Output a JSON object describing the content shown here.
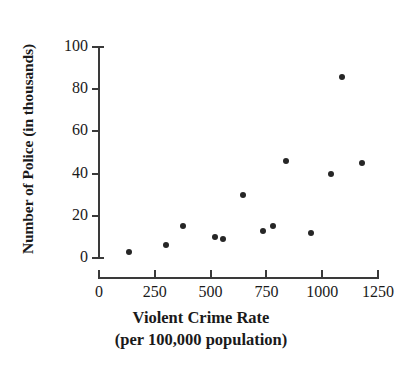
{
  "chart_data": {
    "type": "scatter",
    "title": "",
    "xlabel": "Violent Crime Rate",
    "xlabel_line2": "(per 100,000 population)",
    "ylabel": "Number of Police (in thousands)",
    "xlim": [
      0,
      1250
    ],
    "ylim": [
      0,
      100
    ],
    "xticks": [
      0,
      250,
      500,
      750,
      1000,
      1250
    ],
    "xtick_labels": [
      "0",
      "250",
      "500",
      "750",
      "1000",
      "1250"
    ],
    "yticks": [
      0,
      20,
      40,
      60,
      80,
      100
    ],
    "ytick_labels": [
      "0",
      "20",
      "40",
      "60",
      "80",
      "100"
    ],
    "grid": false,
    "legend": null,
    "marker_color": "#262626",
    "axis_color": "#3a3a3a",
    "points": [
      {
        "x": 135,
        "y": 3
      },
      {
        "x": 300,
        "y": 6
      },
      {
        "x": 375,
        "y": 15
      },
      {
        "x": 520,
        "y": 10
      },
      {
        "x": 555,
        "y": 9
      },
      {
        "x": 645,
        "y": 30
      },
      {
        "x": 735,
        "y": 13
      },
      {
        "x": 780,
        "y": 15
      },
      {
        "x": 840,
        "y": 46
      },
      {
        "x": 950,
        "y": 12
      },
      {
        "x": 1040,
        "y": 40
      },
      {
        "x": 1090,
        "y": 86
      },
      {
        "x": 1180,
        "y": 45
      }
    ]
  }
}
